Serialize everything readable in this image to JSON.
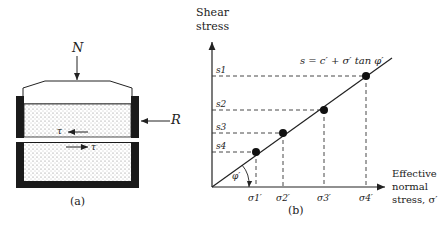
{
  "panel_a": {
    "load_label": "N",
    "reaction_label": "R",
    "shear_top_label": "τ",
    "shear_bottom_label": "τ",
    "caption": "(a)"
  },
  "panel_b": {
    "y_axis_label_line1": "Shear",
    "y_axis_label_line2": "stress",
    "x_axis_label_line1": "Effective",
    "x_axis_label_line2": "normal",
    "x_axis_label_line3": "stress, σ′",
    "equation": "s = c′ + σ′ tan φ′",
    "angle_label": "φ′",
    "caption": "(b)",
    "y_ticks": [
      "s1",
      "s2",
      "s3",
      "s4"
    ],
    "x_ticks": [
      "σ1′",
      "σ2′",
      "σ3′",
      "σ4′"
    ]
  },
  "colors": {
    "ink": "#222222",
    "frame": "#1a1a1a",
    "soil": "#f2f2f2"
  }
}
